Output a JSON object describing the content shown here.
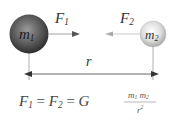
{
  "diagram": {
    "mass1": {
      "label": "m",
      "sub": "1",
      "color": "#555555"
    },
    "mass2": {
      "label": "m",
      "sub": "2",
      "color": "#d8d8d8"
    },
    "force1": {
      "label": "F",
      "sub": "1",
      "direction": "right"
    },
    "force2": {
      "label": "F",
      "sub": "2",
      "direction": "left"
    },
    "distance": {
      "label": "r"
    },
    "formula": {
      "lhs_F": "F",
      "lhs_sub1": "1",
      "eq1": "=",
      "mid_F": "F",
      "lhs_sub2": "2",
      "eq2": "=",
      "G": "G",
      "numerator_m1": "m",
      "numerator_sub1": "1",
      "numerator_m2": "m",
      "numerator_sub2": "2",
      "denominator": "r",
      "denominator_sup": "2"
    }
  }
}
